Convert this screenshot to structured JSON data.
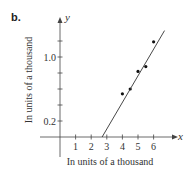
{
  "panel_label": "b.",
  "chart_data": {
    "type": "scatter",
    "title": "",
    "xlabel": "In units of a thousand",
    "ylabel": "In units of a thousand",
    "x_axis_symbol": "x",
    "y_axis_symbol": "y",
    "x_ticks": [
      1,
      2,
      3,
      4,
      5,
      6
    ],
    "x_tick_labels": [
      "1",
      "2",
      "3",
      "4",
      "5",
      "6"
    ],
    "y_ticks": [
      0.2,
      0.4,
      0.6,
      0.8,
      1.0,
      1.2
    ],
    "y_tick_labels": {
      "0.2": "0.2",
      "1.0": "1.0"
    },
    "xlim": [
      0,
      7
    ],
    "ylim": [
      0,
      1.35
    ],
    "grid": false,
    "series": [
      {
        "name": "data points",
        "type": "scatter",
        "x": [
          4.0,
          4.5,
          5.0,
          5.5,
          6.0
        ],
        "y": [
          0.54,
          0.6,
          0.82,
          0.88,
          1.19
        ]
      },
      {
        "name": "fitted line",
        "type": "line",
        "x": [
          2.7,
          6.7
        ],
        "y": [
          0.0,
          1.33
        ]
      }
    ]
  }
}
